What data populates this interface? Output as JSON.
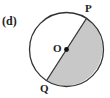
{
  "figure": {
    "label": "(d)",
    "points": {
      "P": "P",
      "Q": "Q",
      "O": "O"
    },
    "colors": {
      "stroke": "#333333",
      "shade": "#c8c8c8",
      "background": "#ffffff"
    }
  }
}
